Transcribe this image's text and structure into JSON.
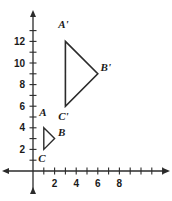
{
  "figure": {
    "background_color": "#ffffff",
    "line_color": "#2b2b2b",
    "label_color": "#1a1a1a",
    "axes": {
      "origin_px": [
        33,
        171
      ],
      "unit_px": 10.8,
      "x_axis": {
        "label": "",
        "tick_labels": [
          "2",
          "4",
          "6",
          "8"
        ],
        "tick_values": [
          2,
          4,
          6,
          8
        ],
        "minor_ticks": [
          1,
          2,
          3,
          4,
          5,
          6,
          7,
          8,
          9,
          10,
          11,
          12
        ],
        "range": [
          -2.3,
          12.9
        ],
        "arrow_both_ends": true
      },
      "y_axis": {
        "label": "",
        "tick_labels": [
          "2",
          "4",
          "6",
          "8",
          "10",
          "12"
        ],
        "tick_values": [
          2,
          4,
          6,
          8,
          10,
          12
        ],
        "minor_ticks": [
          1,
          2,
          3,
          4,
          5,
          6,
          7,
          8,
          9,
          10,
          11,
          12,
          13
        ],
        "range": [
          -1.9,
          13.6
        ],
        "arrow_both_ends": true
      },
      "grid": false
    },
    "shapes": [
      {
        "name": "triangle-abc",
        "kind": "triangle",
        "vertices": [
          {
            "label": "A",
            "x": 1,
            "y": 4,
            "label_offset_px": [
              -1,
              -12
            ]
          },
          {
            "label": "B",
            "x": 2,
            "y": 3,
            "label_offset_px": [
              7,
              -3
            ]
          },
          {
            "label": "C",
            "x": 1,
            "y": 2,
            "label_offset_px": [
              -2,
              13
            ]
          }
        ],
        "stroke": "#2b2b2b",
        "stroke_width": 1.4,
        "fill": "none"
      },
      {
        "name": "triangle-a-prime-b-prime-c-prime",
        "kind": "triangle",
        "vertices": [
          {
            "label": "A'",
            "x": 3,
            "y": 12,
            "label_offset_px": [
              -2,
              -13
            ]
          },
          {
            "label": "B'",
            "x": 6,
            "y": 9,
            "label_offset_px": [
              8,
              -3
            ]
          },
          {
            "label": "C'",
            "x": 3,
            "y": 6,
            "label_offset_px": [
              -2,
              14
            ]
          }
        ],
        "stroke": "#2b2b2b",
        "stroke_width": 1.6,
        "fill": "none"
      }
    ]
  }
}
